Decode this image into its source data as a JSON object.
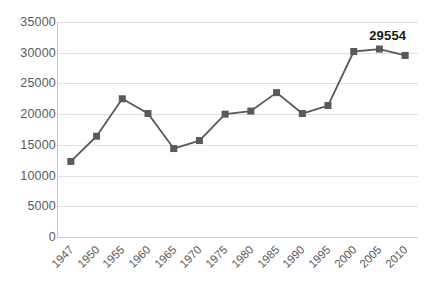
{
  "chart_data": {
    "type": "line",
    "title": "",
    "subtitle": "",
    "xlabel": "",
    "ylabel": "",
    "categories": [
      "1947",
      "1950",
      "1955",
      "1960",
      "1965",
      "1970",
      "1975",
      "1980",
      "1985",
      "1990",
      "1995",
      "2000",
      "2005",
      "2010"
    ],
    "values": [
      12300,
      16400,
      22500,
      20100,
      14400,
      15700,
      20000,
      20500,
      23500,
      20100,
      21400,
      30200,
      30600,
      29554
    ],
    "series": [
      {
        "name": "",
        "values": [
          12300,
          16400,
          22500,
          20100,
          14400,
          15700,
          20000,
          20500,
          23500,
          20100,
          21400,
          30200,
          30600,
          29554
        ]
      }
    ],
    "ylim": [
      0,
      35000
    ],
    "y_ticks": [
      "0",
      "5000",
      "10000",
      "15000",
      "20000",
      "25000",
      "30000",
      "35000"
    ],
    "y_tick_values": [
      0,
      5000,
      10000,
      15000,
      20000,
      25000,
      30000,
      35000
    ],
    "grid": true,
    "legend": false,
    "legend_position": "none",
    "annotations": [
      {
        "text": "29554",
        "category": "2010",
        "value": 29554,
        "bold": true
      }
    ],
    "colors": {
      "line": "#595959",
      "marker": "#595959",
      "gridline": "#e2e2e2",
      "axis": "#c9c9c9",
      "tick_label": "#5a5a5a",
      "annotation": "#1a1a1a",
      "background": "#ffffff"
    },
    "marker": "square",
    "x_tick_rotation": -45
  }
}
